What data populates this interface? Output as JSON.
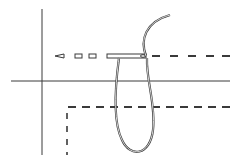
{
  "diagram": {
    "colors": {
      "background": "#ffffff",
      "ink": "#3a3a3a"
    },
    "fabric_edges": {
      "vertical_line": {
        "x1": 42,
        "y1": 9,
        "x2": 42,
        "y2": 155
      },
      "horizontal_line": {
        "x1": 11,
        "y1": 81,
        "x2": 230,
        "y2": 81
      }
    },
    "upper_stitch_row": {
      "y": 56,
      "needle": {
        "x_start": 107,
        "x_end": 146,
        "height": 4,
        "eye_x": 143
      },
      "needle_tip": {
        "points": "55,56 64,54 64,58"
      },
      "stitches_in_fabric": [
        {
          "x": 75,
          "w": 7
        },
        {
          "x": 89,
          "w": 7
        }
      ],
      "dashes_after": [
        {
          "x": 152,
          "w": 8
        },
        {
          "x": 170,
          "w": 8
        },
        {
          "x": 188,
          "w": 8
        },
        {
          "x": 206,
          "w": 8
        },
        {
          "x": 222,
          "w": 8
        }
      ]
    },
    "lower_stitch_row": {
      "y": 107,
      "dash_pattern": "8 6",
      "x_start": 68,
      "x_end": 230,
      "vertical": {
        "x": 67,
        "y_start": 113,
        "y_end": 155,
        "dash_pattern": "6 7"
      }
    },
    "thread": {
      "tail_path": "M146,56 C140,40 145,22 170,15",
      "loop_path": "M119,58 C116,80 112,120 122,140 C130,158 150,156 153,130 C156,105 146,80 147,58"
    }
  }
}
